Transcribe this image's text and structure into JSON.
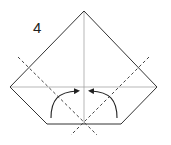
{
  "diagram": {
    "step_number": "4",
    "type": "origami-fold-instruction",
    "colors": {
      "outline": "#333333",
      "crease": "#999999",
      "dashed_fold": "#444444",
      "arrow": "#222222",
      "background": "#ffffff"
    },
    "shape": {
      "name": "pentagon-paper",
      "points": [
        [
          84,
          11
        ],
        [
          157,
          87
        ],
        [
          121,
          124
        ],
        [
          47,
          124
        ],
        [
          10,
          87
        ]
      ]
    },
    "creases": [
      {
        "name": "vertical-crease",
        "from": [
          84,
          11
        ],
        "to": [
          84,
          124
        ]
      },
      {
        "name": "horizontal-crease",
        "from": [
          10,
          87
        ],
        "to": [
          157,
          87
        ]
      }
    ],
    "fold_lines": [
      {
        "name": "valley-fold-left",
        "from": [
          18,
          57
        ],
        "to": [
          97,
          135
        ]
      },
      {
        "name": "valley-fold-right",
        "from": [
          149,
          57
        ],
        "to": [
          71,
          135
        ]
      }
    ],
    "arrows": [
      {
        "name": "fold-arrow-left",
        "direction": "right"
      },
      {
        "name": "fold-arrow-right",
        "direction": "left"
      }
    ]
  }
}
